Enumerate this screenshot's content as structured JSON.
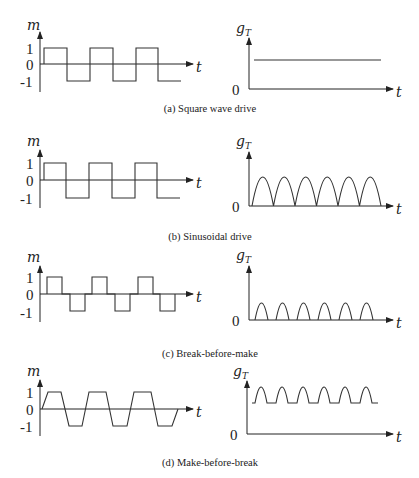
{
  "figure": {
    "panels": [
      {
        "id": "a",
        "caption": "(a) Square wave drive",
        "left": {
          "ylabel": "m",
          "xlabel": "t",
          "ticks": [
            "1",
            "0",
            "-1"
          ]
        },
        "right": {
          "ylabel": "g",
          "ylabel_sub": "T",
          "xlabel": "t",
          "origin": "0"
        }
      },
      {
        "id": "b",
        "caption": "(b) Sinusoidal drive",
        "left": {
          "ylabel": "m",
          "xlabel": "t",
          "ticks": [
            "1",
            "0",
            "-1"
          ]
        },
        "right": {
          "ylabel": "g",
          "ylabel_sub": "T",
          "xlabel": "t",
          "origin": "0"
        }
      },
      {
        "id": "c",
        "caption": "(c) Break-before-make",
        "left": {
          "ylabel": "m",
          "xlabel": "t",
          "ticks": [
            "1",
            "0",
            "-1"
          ]
        },
        "right": {
          "ylabel": "g",
          "ylabel_sub": "T",
          "xlabel": "t",
          "origin": "0"
        }
      },
      {
        "id": "d",
        "caption": "(d) Make-before-break",
        "left": {
          "ylabel": "m",
          "xlabel": "t",
          "ticks": [
            "1",
            "0",
            "-1"
          ]
        },
        "right": {
          "ylabel": "g",
          "ylabel_sub": "T",
          "xlabel": "t",
          "origin": "0"
        }
      }
    ],
    "descriptions": {
      "a": "Left: square wave m(t) switching between +1 and -1 (3 periods). Right: g_T constant flat line.",
      "b": "Left: square wave m(t) between +1 and -1. Right: g_T is a train of 6 rectified-sine arches touching zero.",
      "c": "Left: pulses at +1 and -1 separated by zero dead-time intervals. Right: g_T is 6 smaller arches with gaps at zero.",
      "d": "Left: trapezoidal wave with overlapping transitions between +1 and -1. Right: g_T is 6 bumps riding on a non-zero floor."
    }
  }
}
